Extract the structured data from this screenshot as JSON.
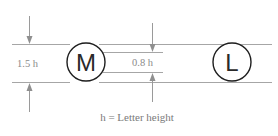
{
  "diagram": {
    "left_dimension_label": "1.5 h",
    "inner_dimension_label": "0.8 h",
    "circled_letters": [
      "M",
      "L"
    ],
    "caption": "h = Letter height",
    "colors": {
      "guide_lines": "#a6a6a6",
      "circles": "#1e1e1e",
      "text": "#8a8a8a"
    }
  }
}
